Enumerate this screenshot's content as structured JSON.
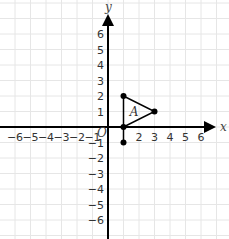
{
  "chart_data": {
    "type": "coordinate-plane",
    "title": "",
    "xlabel": "x",
    "ylabel": "y",
    "xlim": [
      -7,
      7
    ],
    "ylim": [
      -7,
      7
    ],
    "grid": true,
    "x_ticks": [
      "-6",
      "-5",
      "-4",
      "-3",
      "-2",
      "-1",
      "2",
      "3",
      "4",
      "5",
      "6"
    ],
    "y_ticks": [
      "6",
      "5",
      "4",
      "3",
      "2",
      "1",
      "-1",
      "-2",
      "-3",
      "-4",
      "-5",
      "-6"
    ],
    "origin_label": "O",
    "shapes": [
      {
        "name": "A",
        "kind": "triangle",
        "vertices": [
          [
            1,
            0
          ],
          [
            1,
            2
          ],
          [
            3,
            1
          ]
        ]
      }
    ],
    "segments": [
      {
        "from": [
          1,
          0
        ],
        "to": [
          1,
          -1
        ]
      }
    ],
    "points": [
      [
        1,
        0
      ],
      [
        1,
        2
      ],
      [
        3,
        1
      ],
      [
        1,
        -1
      ]
    ]
  },
  "labels": {
    "x_axis": "x",
    "y_axis": "y",
    "origin": "O",
    "shape_name": "A"
  },
  "colors": {
    "grid": "#e6e6e6",
    "axis": "#000000",
    "shape": "#000000",
    "text": "#333333"
  }
}
